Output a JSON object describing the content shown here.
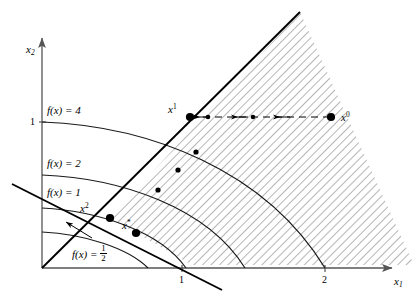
{
  "figure": {
    "type": "math-diagram",
    "axes": {
      "x_label": "x",
      "x_label_sub": "1",
      "y_label": "x",
      "y_label_sub": "2",
      "x_ticks": [
        "1",
        "2"
      ],
      "y_ticks": [
        "1"
      ]
    },
    "level_curves": [
      {
        "id": "f4",
        "text_prefix": "f(x) = ",
        "value": "4"
      },
      {
        "id": "f2",
        "text_prefix": "f(x) = ",
        "value": "2"
      },
      {
        "id": "f1",
        "text_prefix": "f(x) = ",
        "value": "1"
      },
      {
        "id": "fhalf",
        "text_prefix": "f(x) = ",
        "value_num": "1",
        "value_den": "2"
      }
    ],
    "points": [
      {
        "id": "x0",
        "base": "x",
        "sup": "0"
      },
      {
        "id": "x1",
        "base": "x",
        "sup": "1"
      },
      {
        "id": "x2",
        "base": "x",
        "sup": "2"
      },
      {
        "id": "xstar",
        "base": "x",
        "sup": "*"
      }
    ],
    "colors": {
      "ink": "#000000",
      "axis": "#555555",
      "hatch": "#777777",
      "curve": "#1a1a1a"
    }
  }
}
